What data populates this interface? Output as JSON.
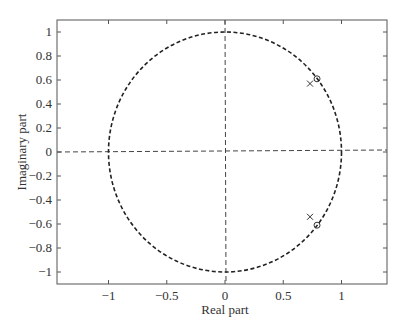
{
  "chart_data": {
    "type": "scatter",
    "title": "",
    "xlabel": "Real part",
    "ylabel": "Imaginary part",
    "xlim": [
      -1.45,
      1.4
    ],
    "ylim": [
      -1.1,
      1.1
    ],
    "xticks": [
      -1,
      -0.5,
      0,
      0.5,
      1
    ],
    "xtick_labels": [
      "−1",
      "−0.5",
      "0",
      "0.5",
      "1"
    ],
    "yticks": [
      1,
      0.8,
      0.6,
      0.4,
      0.2,
      0,
      -0.2,
      -0.4,
      -0.6,
      -0.8,
      -1
    ],
    "ytick_labels": [
      "1",
      "0.8",
      "0.6",
      "0.4",
      "0.2",
      "0",
      "−0.2",
      "−0.4",
      "−0.6",
      "−0.8",
      "−1"
    ],
    "grid": false,
    "legend": null,
    "unit_circle": {
      "radius": 1,
      "style": "dashed"
    },
    "reference_lines": [
      {
        "orientation": "horizontal",
        "value": 0,
        "style": "dashed"
      },
      {
        "orientation": "vertical",
        "value": 0,
        "style": "dashed"
      }
    ],
    "series": [
      {
        "name": "zeros",
        "marker": "o",
        "points": [
          [
            0.79,
            0.61
          ],
          [
            0.79,
            -0.61
          ]
        ]
      },
      {
        "name": "poles",
        "marker": "x",
        "points": [
          [
            0.73,
            0.57
          ],
          [
            0.73,
            -0.54
          ]
        ]
      }
    ]
  }
}
